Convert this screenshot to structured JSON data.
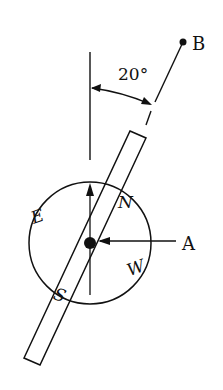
{
  "diagram": {
    "type": "compass-on-bar",
    "colors": {
      "ink": "#111111",
      "background": "#ffffff"
    },
    "labels": {
      "point_b": "B",
      "point_a": "A",
      "angle": "20°",
      "north": "N",
      "south": "S",
      "east": "E",
      "west": "W"
    },
    "geometry": {
      "angle_from_vertical_deg": 20,
      "compass_center": [
        90,
        243
      ],
      "compass_radius": 61,
      "point_b": [
        183,
        42
      ],
      "point_a_label": [
        182,
        245
      ]
    }
  }
}
